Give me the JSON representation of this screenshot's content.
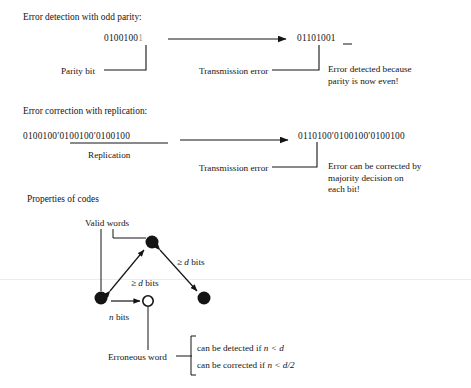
{
  "page": {
    "width": 471,
    "height": 388,
    "background": "#ffffff",
    "ink": "#141414"
  },
  "section_parity": {
    "heading": "Error detection with odd parity:",
    "source_word": "0100100",
    "source_parity_bit": "1",
    "received_word": "01101001",
    "label_parity_bit": "Parity bit",
    "label_transmission_error": "Transmission error",
    "note_line1": "Error detected because",
    "note_line2": "parity is now even!"
  },
  "section_replication": {
    "heading": "Error correction with replication:",
    "source_word": "0100100′0100100′0100100",
    "received_word": "0110100′0100100′0100100",
    "label_replication": "Replication",
    "label_transmission_error": "Transmission error",
    "note_line1": "Error can be corrected by",
    "note_line2": "majority decision on",
    "note_line3": "each bit!"
  },
  "section_properties": {
    "heading": "Properties of codes",
    "label_valid_words": "Valid words",
    "label_erroneous_word": "Erroneous word",
    "label_n_bits_prefix": "n",
    "label_n_bits_suffix": " bits",
    "label_d_bits_left_prefix": "≥ ",
    "label_d_bits_left_var": "d",
    "label_d_bits_left_suffix": " bits",
    "label_d_bits_right_prefix": "≥ ",
    "label_d_bits_right_var": "d",
    "label_d_bits_right_suffix": " bits",
    "brace_line1_prefix": "can be detected if ",
    "brace_line1_var": "n < d",
    "brace_line2_prefix": "can be corrected if ",
    "brace_line2_var": "n < d/2",
    "nodes": [
      {
        "name": "valid-word-top",
        "x": 152,
        "y": 242,
        "r": 6.5,
        "filled": true
      },
      {
        "name": "valid-word-left",
        "x": 101,
        "y": 298,
        "r": 6.5,
        "filled": true
      },
      {
        "name": "valid-word-right",
        "x": 204,
        "y": 298,
        "r": 6.5,
        "filled": true
      },
      {
        "name": "erroneous-word",
        "x": 148,
        "y": 301,
        "r": 5.5,
        "filled": false
      }
    ]
  }
}
